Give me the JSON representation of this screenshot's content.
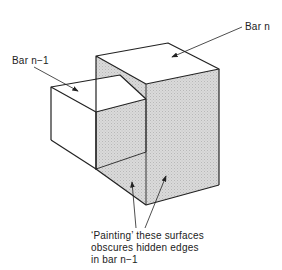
{
  "diagram": {
    "labels": {
      "bar_n": "Bar n",
      "bar_n_minus_1": "Bar n−1",
      "note_line1": "‘Painting’ these surfaces",
      "note_line2": "obscures hidden edges",
      "note_line3": "in bar n−1"
    },
    "colors": {
      "line": "#222222",
      "shade": "#d4d4d4",
      "background": "#ffffff"
    }
  }
}
